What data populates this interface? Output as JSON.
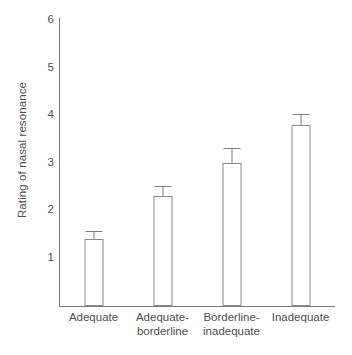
{
  "chart_data": {
    "type": "bar",
    "title": "",
    "xlabel": "",
    "ylabel": "Rating of nasal resonance",
    "categories": [
      "Adequate",
      "Adequate-borderline",
      "Borderline-inadequate",
      "Inadequate"
    ],
    "category_lines": [
      [
        "Adequate"
      ],
      [
        "Adequate-",
        "borderline"
      ],
      [
        "Borderline-",
        "inadequate"
      ],
      [
        "Inadequate"
      ]
    ],
    "values": [
      1.4,
      2.3,
      3.0,
      3.8
    ],
    "errors_upper": [
      0.15,
      0.2,
      0.3,
      0.2
    ],
    "error_direction": "upper-only",
    "ylim": [
      0,
      6
    ],
    "yticks": [
      1,
      2,
      3,
      4,
      5,
      6
    ],
    "ytick_labels": [
      "1",
      "2",
      "3",
      "4",
      "5",
      "6"
    ],
    "grid": false,
    "legend": false,
    "bar_fill": "#ffffff",
    "bar_stroke": "#8a8a8a",
    "axis_color": "#7d7d7d",
    "text_color": "#4d4d4d",
    "background": "#ffffff"
  }
}
